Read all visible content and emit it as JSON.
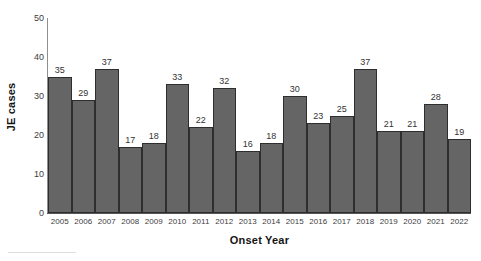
{
  "chart_data": {
    "type": "bar",
    "title": "",
    "xlabel": "Onset Year",
    "ylabel": "JE cases",
    "categories": [
      "2005",
      "2006",
      "2007",
      "2008",
      "2009",
      "2010",
      "2011",
      "2012",
      "2013",
      "2014",
      "2015",
      "2016",
      "2017",
      "2018",
      "2019",
      "2020",
      "2021",
      "2022"
    ],
    "values": [
      35,
      29,
      37,
      17,
      18,
      33,
      22,
      32,
      16,
      18,
      30,
      23,
      25,
      37,
      21,
      21,
      28,
      19
    ],
    "series": [
      {
        "name": "JE cases",
        "values": [
          35,
          29,
          37,
          17,
          18,
          33,
          22,
          32,
          16,
          18,
          30,
          23,
          25,
          37,
          21,
          21,
          28,
          19
        ]
      }
    ],
    "ylim": [
      0,
      50
    ],
    "y_ticks": [
      0,
      10,
      20,
      30,
      40,
      50
    ],
    "y_tick_labels": [
      "0",
      "10",
      "20",
      "30",
      "40",
      "50"
    ],
    "grid": false,
    "legend": false,
    "legend_position": "none",
    "data_labels": true,
    "bar_gap": 0,
    "colors": {
      "bar_fill": "#656565",
      "bar_stroke": "#2e2e2e",
      "axis": "#555555",
      "text": "#333333",
      "background": "#ffffff"
    }
  }
}
